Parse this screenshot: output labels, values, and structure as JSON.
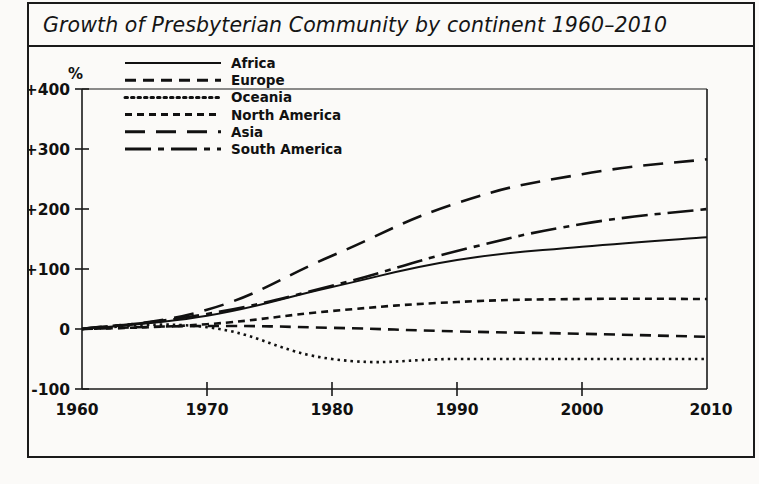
{
  "figure": {
    "title": "Growth of Presbyterian Community by continent 1960–2010",
    "frame_color": "#1a1a1a",
    "background_color": "#fbfaf8",
    "line_color": "#111111"
  },
  "chart_data": {
    "type": "line",
    "title": "Growth of Presbyterian Community by continent 1960–2010",
    "xlabel": "",
    "ylabel": "%",
    "x": [
      1960,
      1970,
      1980,
      1990,
      2000,
      2010
    ],
    "xtick_labels": [
      "1960",
      "1970",
      "1980",
      "1990",
      "2000",
      "2010"
    ],
    "ytick_labels": [
      "+400",
      "+300",
      "+200",
      "+100",
      "0",
      "-100"
    ],
    "yticks": [
      400,
      300,
      200,
      100,
      0,
      -100
    ],
    "xlim": [
      1960,
      2010
    ],
    "ylim": [
      -100,
      400
    ],
    "grid": false,
    "legend_position": "upper-left-inside",
    "series": [
      {
        "name": "Africa",
        "style": "solid",
        "dasharray": "",
        "values": [
          0,
          22,
          70,
          115,
          137,
          153
        ]
      },
      {
        "name": "Europe",
        "style": "dashed",
        "dasharray": "11,7",
        "values": [
          0,
          5,
          2,
          -4,
          -8,
          -13
        ]
      },
      {
        "name": "Oceania",
        "style": "dotted",
        "dasharray": "2.5,4",
        "values": [
          0,
          3,
          -50,
          -50,
          -50,
          -50
        ]
      },
      {
        "name": "North America",
        "style": "small-dash",
        "dasharray": "7,5",
        " values": [],
        "values": [
          0,
          8,
          30,
          45,
          50,
          50
        ]
      },
      {
        "name": "Asia",
        "style": "long-dash",
        "dasharray": "20,11",
        "values": [
          0,
          32,
          122,
          210,
          258,
          283
        ]
      },
      {
        "name": "South America",
        "style": "dash-dot",
        "dasharray": "26,7,6,7",
        "values": [
          0,
          25,
          72,
          130,
          175,
          200
        ]
      }
    ]
  },
  "legend": {
    "items": [
      {
        "label": "Africa"
      },
      {
        "label": "Europe"
      },
      {
        "label": "Oceania"
      },
      {
        "label": "North America"
      },
      {
        "label": "Asia"
      },
      {
        "label": "South America"
      }
    ]
  }
}
